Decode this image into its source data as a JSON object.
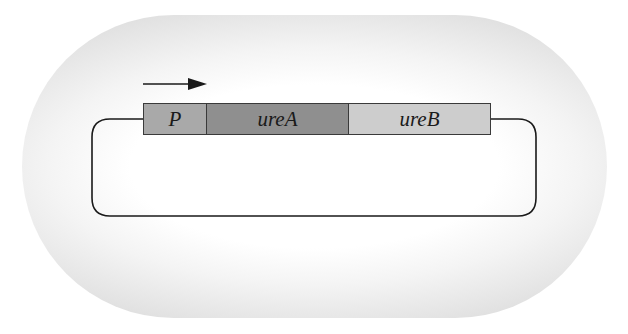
{
  "diagram": {
    "type": "plasmid-operon",
    "transcription_direction": "left-to-right",
    "genes": [
      {
        "id": "P",
        "label": "P",
        "role": "promoter",
        "fill": "#a9a9a9"
      },
      {
        "id": "ureA",
        "label": "ureA",
        "role": "gene",
        "fill": "#8f8f8f"
      },
      {
        "id": "ureB",
        "label": "ureB",
        "role": "gene",
        "fill": "#cdcdcd"
      }
    ],
    "colors": {
      "background_cell": "#e2e2e2",
      "line": "#1a1a1a",
      "box_border": "#3a3a3a"
    },
    "arrow_icon": "right-arrow-icon"
  }
}
